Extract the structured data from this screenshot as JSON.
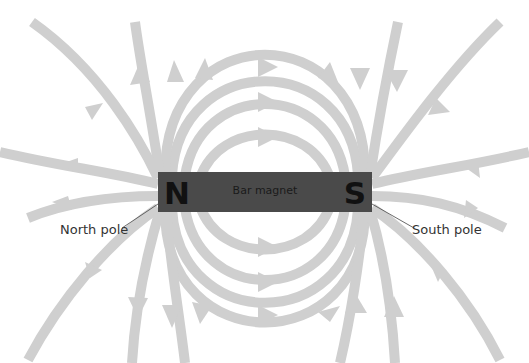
{
  "diagram": {
    "magnet": {
      "label": "Bar magnet",
      "north_letter": "N",
      "south_letter": "S",
      "color": "#4a4a4a"
    },
    "callouts": {
      "north": "North pole",
      "south": "South pole"
    },
    "colors": {
      "field_line": "#cfcfcf",
      "background": "#ffffff",
      "text": "#333333"
    }
  }
}
